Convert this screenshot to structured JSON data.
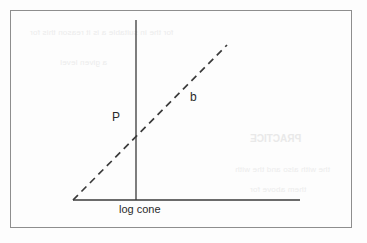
{
  "figure": {
    "border_color": "#8e8e8e",
    "ink_color": "#3a3a3a",
    "background_color": "#fdfdfd"
  },
  "labels": {
    "x_axis": "log cone",
    "point": "P",
    "slope": "b"
  },
  "bleed_through": {
    "line_1": "for the in suitable a is it reason this for",
    "line_2": "a given level",
    "heading": "PRACTICE",
    "line_3": "the with also and the with",
    "line_4": "them above for"
  },
  "chart_data": {
    "type": "line",
    "title": "",
    "xlabel": "log cone",
    "ylabel": "",
    "grid": false,
    "legend": null,
    "axes": {
      "x_axis": {
        "x1": 73,
        "y1": 200,
        "x2": 300,
        "y2": 200,
        "style": "solid"
      },
      "y_axis": {
        "x1": 136,
        "y1": 20,
        "x2": 136,
        "y2": 200,
        "style": "solid"
      }
    },
    "series": [
      {
        "name": "b",
        "style": "dashed",
        "x": [
          73,
          227
        ],
        "y": [
          200,
          45
        ],
        "annotations": [
          {
            "label": "P",
            "x": 136,
            "y": 133,
            "note": "intercept on vertical axis"
          },
          {
            "label": "b",
            "x": 194,
            "y": 97,
            "note": "slope of dashed line"
          }
        ]
      }
    ]
  }
}
